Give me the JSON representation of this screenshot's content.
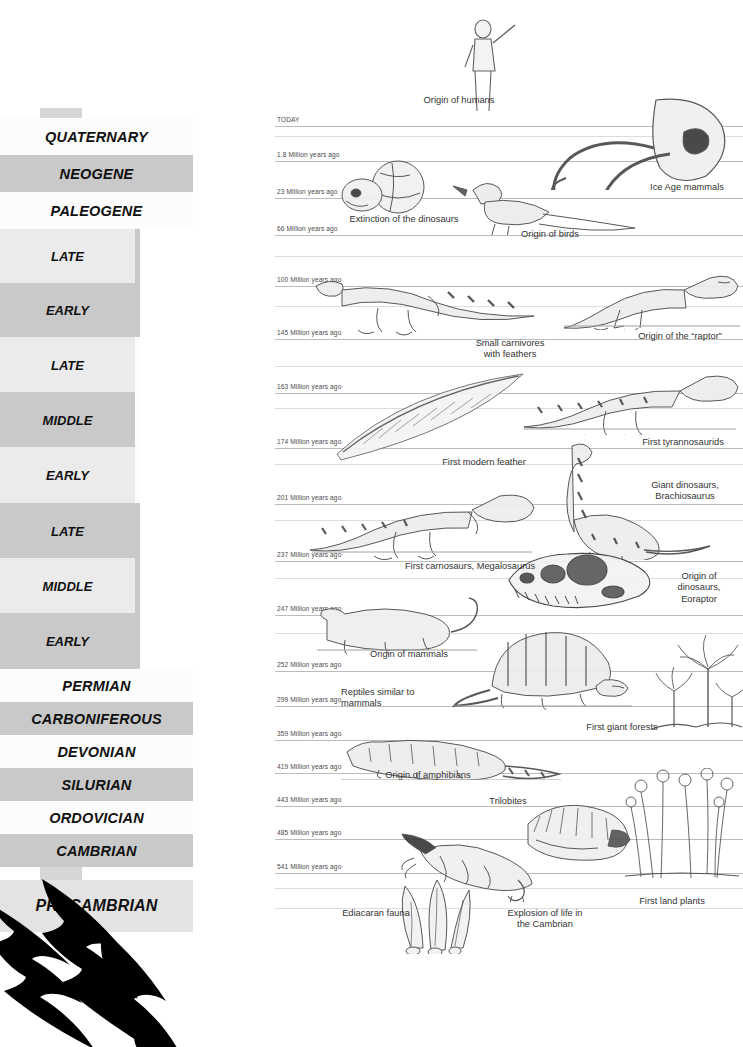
{
  "palette": {
    "era_bg": "#d6d6d6",
    "shade_light": "#fcfcfc",
    "shade_mid": "#ebebeb",
    "shade_dark": "#c9c9c9",
    "shade_dark2": "#bdbdbd",
    "tick_line": "#bcbcbc",
    "text": "#111111",
    "anno_text": "#333333",
    "claw": "#000000"
  },
  "eras": [
    {
      "name": "CENOZOIC",
      "top": 108,
      "height": 113,
      "font_size": 16
    },
    {
      "name": "MESOZOIC",
      "top": 221,
      "height": 447,
      "font_size": 22
    },
    {
      "name": "PALEOZOIC",
      "top": 668,
      "height": 212,
      "font_size": 16
    }
  ],
  "periods": [
    {
      "name": "QUATERNARY",
      "top": 118,
      "height": 37,
      "shade": "#fcfcfc",
      "full": true
    },
    {
      "name": "NEOGENE",
      "top": 155,
      "height": 37,
      "shade": "#c9c9c9",
      "full": true
    },
    {
      "name": "PALEOGENE",
      "top": 192,
      "height": 37,
      "shade": "#fcfcfc",
      "full": true
    },
    {
      "name": "PERMIAN",
      "top": 669,
      "height": 33,
      "shade": "#fcfcfc",
      "full": true
    },
    {
      "name": "CARBONIFEROUS",
      "top": 702,
      "height": 33,
      "shade": "#c9c9c9",
      "full": true
    },
    {
      "name": "DEVONIAN",
      "top": 735,
      "height": 33,
      "shade": "#fcfcfc",
      "full": true
    },
    {
      "name": "SILURIAN",
      "top": 768,
      "height": 33,
      "shade": "#c9c9c9",
      "full": true
    },
    {
      "name": "ORDOVICIAN",
      "top": 801,
      "height": 33,
      "shade": "#fcfcfc",
      "full": true
    },
    {
      "name": "CAMBRIAN",
      "top": 834,
      "height": 33,
      "shade": "#c9c9c9",
      "full": true
    },
    {
      "name": "PRECAMBRIAN",
      "top": 880,
      "height": 52,
      "shade": "#e3e3e3",
      "full": true
    }
  ],
  "subperiods": [
    {
      "name": "CRETACEOUS",
      "top": 229,
      "height": 108,
      "shade": "#c9c9c9"
    },
    {
      "name": "JURASSIC",
      "top": 337,
      "height": 166,
      "shade": "#fcfcfc"
    },
    {
      "name": "TRIASSIC",
      "top": 503,
      "height": 166,
      "shade": "#c9c9c9"
    }
  ],
  "epochs": [
    {
      "name": "LATE",
      "top": 229,
      "height": 54,
      "shade": "#ebebeb"
    },
    {
      "name": "EARLY",
      "top": 283,
      "height": 54,
      "shade": "#c9c9c9"
    },
    {
      "name": "LATE",
      "top": 337,
      "height": 55,
      "shade": "#ebebeb"
    },
    {
      "name": "MIDDLE",
      "top": 392,
      "height": 55,
      "shade": "#c9c9c9"
    },
    {
      "name": "EARLY",
      "top": 447,
      "height": 56,
      "shade": "#ebebeb"
    },
    {
      "name": "LATE",
      "top": 503,
      "height": 55,
      "shade": "#c9c9c9"
    },
    {
      "name": "MIDDLE",
      "top": 558,
      "height": 55,
      "shade": "#ebebeb"
    },
    {
      "name": "EARLY",
      "top": 613,
      "height": 56,
      "shade": "#c9c9c9"
    }
  ],
  "time_ticks": [
    {
      "label": "TODAY",
      "y": 8,
      "line": true
    },
    {
      "label": "1.8 Million years ago",
      "y": 43,
      "line": true
    },
    {
      "label": "23 Million years ago",
      "y": 80,
      "line": true
    },
    {
      "label": "66 Million years ago",
      "y": 117,
      "line": true
    },
    {
      "label": "100 Million years ago",
      "y": 168,
      "line": true
    },
    {
      "label": "145 Million years ago",
      "y": 221,
      "line": true
    },
    {
      "label": "163 Million years ago",
      "y": 275,
      "line": true
    },
    {
      "label": "174 Million years ago",
      "y": 330,
      "line": true
    },
    {
      "label": "201 Million years ago",
      "y": 386,
      "line": true
    },
    {
      "label": "237 Million years ago",
      "y": 443,
      "line": true
    },
    {
      "label": "247 Million years ago",
      "y": 497,
      "line": true
    },
    {
      "label": "252 Million years ago",
      "y": 553,
      "line": true
    },
    {
      "label": "299 Million years ago",
      "y": 588,
      "line": true
    },
    {
      "label": "359 Million years ago",
      "y": 622,
      "line": true
    },
    {
      "label": "419 Million years ago",
      "y": 655,
      "line": true
    },
    {
      "label": "443 Million years ago",
      "y": 688,
      "line": true
    },
    {
      "label": "485 Million years ago",
      "y": 721,
      "line": true
    },
    {
      "label": "541 Million years ago",
      "y": 755,
      "line": true
    }
  ],
  "annotations": [
    {
      "id": "origin-of-humans",
      "text": "Origin of humans",
      "left": 399,
      "top": 95,
      "width": 120,
      "align": "c"
    },
    {
      "id": "ice-age-mammals",
      "text": "Ice Age mammals",
      "left": 633,
      "top": 182,
      "width": 108,
      "align": "c"
    },
    {
      "id": "extinction-dinosaurs",
      "text": "Extinction of the dinosaurs",
      "left": 329,
      "top": 214,
      "width": 150,
      "align": "c"
    },
    {
      "id": "origin-of-birds",
      "text": "Origin of birds",
      "left": 500,
      "top": 229,
      "width": 100,
      "align": "c"
    },
    {
      "id": "origin-of-raptor",
      "text": "Origin of the “raptor”",
      "left": 620,
      "top": 331,
      "width": 120,
      "align": "c"
    },
    {
      "id": "small-carnivores",
      "text": "Small carnivores\nwith feathers",
      "left": 455,
      "top": 338,
      "width": 110,
      "align": "c"
    },
    {
      "id": "first-tyrannosaurids",
      "text": "First tyrannosaurids",
      "left": 625,
      "top": 437,
      "width": 116,
      "align": "c"
    },
    {
      "id": "first-modern-feather",
      "text": "First modern feather",
      "left": 420,
      "top": 457,
      "width": 128,
      "align": "c"
    },
    {
      "id": "giant-dinosaurs",
      "text": "Giant dinosaurs,\nBrachiosaurus",
      "left": 630,
      "top": 480,
      "width": 110,
      "align": "c"
    },
    {
      "id": "first-carnosaurs",
      "text": "First carnosaurs, Megalosaurus",
      "left": 380,
      "top": 561,
      "width": 180,
      "align": "c"
    },
    {
      "id": "origin-of-dinosaurs",
      "text": "Origin of\ndinosaurs,\nEoraptor",
      "left": 656,
      "top": 571,
      "width": 86,
      "align": "c"
    },
    {
      "id": "origin-of-mammals",
      "text": "Origin of mammals",
      "left": 350,
      "top": 649,
      "width": 118,
      "align": "c"
    },
    {
      "id": "reptiles-similar",
      "text": "Reptiles similar to\nmammals",
      "left": 341,
      "top": 687,
      "width": 108,
      "align": "l"
    },
    {
      "id": "first-giant-forests",
      "text": "First giant forests",
      "left": 566,
      "top": 722,
      "width": 112,
      "align": "c"
    },
    {
      "id": "origin-of-amphibians",
      "text": "Origin of amphibians",
      "left": 365,
      "top": 770,
      "width": 126,
      "align": "c"
    },
    {
      "id": "trilobites",
      "text": "Trilobites",
      "left": 473,
      "top": 796,
      "width": 70,
      "align": "c"
    },
    {
      "id": "first-land-plants",
      "text": "First land plants",
      "left": 620,
      "top": 896,
      "width": 104,
      "align": "c"
    },
    {
      "id": "ediacaran-fauna",
      "text": "Ediacaran fauna",
      "left": 323,
      "top": 908,
      "width": 106,
      "align": "c"
    },
    {
      "id": "explosion-of-life",
      "text": "Explosion of life in\nthe Cambrian",
      "left": 489,
      "top": 908,
      "width": 112,
      "align": "c"
    }
  ],
  "illustrations": [
    {
      "id": "human-figure",
      "left": 449,
      "top": 15,
      "width": 74,
      "height": 100
    },
    {
      "id": "mammoth-skull",
      "left": 536,
      "top": 92,
      "width": 200,
      "height": 98
    },
    {
      "id": "primate-skull-globe",
      "left": 336,
      "top": 159,
      "width": 96,
      "height": 58
    },
    {
      "id": "archaeopteryx-bird",
      "left": 443,
      "top": 172,
      "width": 212,
      "height": 63
    },
    {
      "id": "raptor-dinosaur",
      "left": 560,
      "top": 258,
      "width": 180,
      "height": 72
    },
    {
      "id": "feathered-carnivore",
      "left": 308,
      "top": 256,
      "width": 235,
      "height": 80
    },
    {
      "id": "tyrannosaurid",
      "left": 520,
      "top": 363,
      "width": 220,
      "height": 72
    },
    {
      "id": "feather",
      "left": 333,
      "top": 368,
      "width": 200,
      "height": 100
    },
    {
      "id": "megalosaurus",
      "left": 308,
      "top": 482,
      "width": 230,
      "height": 78
    },
    {
      "id": "brachiosaurus",
      "left": 530,
      "top": 440,
      "width": 185,
      "height": 120
    },
    {
      "id": "eoraptor-skull",
      "left": 503,
      "top": 548,
      "width": 148,
      "height": 62
    },
    {
      "id": "early-mammal",
      "left": 315,
      "top": 592,
      "width": 165,
      "height": 62
    },
    {
      "id": "dimetrodon",
      "left": 452,
      "top": 628,
      "width": 185,
      "height": 82
    },
    {
      "id": "giant-forest-trees",
      "left": 650,
      "top": 623,
      "width": 93,
      "height": 110
    },
    {
      "id": "amphibian",
      "left": 339,
      "top": 730,
      "width": 225,
      "height": 50
    },
    {
      "id": "trilobite",
      "left": 522,
      "top": 800,
      "width": 110,
      "height": 62
    },
    {
      "id": "crinoids",
      "left": 623,
      "top": 768,
      "width": 118,
      "height": 112
    },
    {
      "id": "anomalocaris",
      "left": 400,
      "top": 830,
      "width": 155,
      "height": 72
    },
    {
      "id": "ediacaran-fronds",
      "left": 387,
      "top": 872,
      "width": 85,
      "height": 82
    }
  ],
  "decor": {
    "claw_marks_label": "claw-marks"
  }
}
